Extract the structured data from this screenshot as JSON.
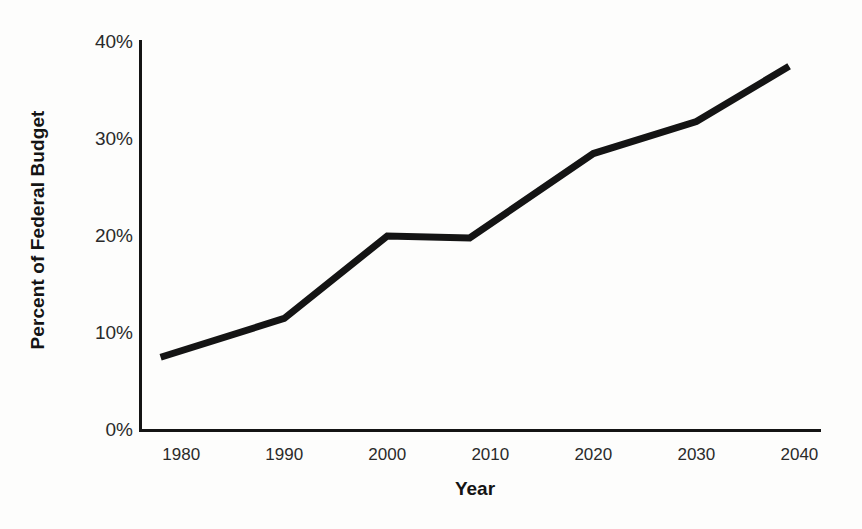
{
  "chart_data": {
    "type": "line",
    "title": "",
    "xlabel": "Year",
    "ylabel": "Percent of Federal Budget",
    "x": [
      1978,
      1990,
      2000,
      2008,
      2020,
      2030,
      2039
    ],
    "values": [
      7.5,
      11.5,
      20.0,
      19.8,
      28.5,
      31.8,
      37.5
    ],
    "x_tick_labels": [
      "1980",
      "1990",
      "2000",
      "2010",
      "2020",
      "2030",
      "2040"
    ],
    "x_tick_values": [
      1980,
      1990,
      2000,
      2010,
      2020,
      2030,
      2040
    ],
    "y_tick_labels": [
      "0%",
      "10%",
      "20%",
      "30%",
      "40%"
    ],
    "y_tick_values": [
      0,
      10,
      20,
      30,
      40
    ],
    "xlim": [
      1976,
      2042
    ],
    "ylim": [
      0,
      40
    ],
    "grid": false,
    "legend": "none",
    "series_color": "#141414",
    "line_width": 7,
    "background_color": "#fdfdfc",
    "axis_color": "#141414"
  }
}
